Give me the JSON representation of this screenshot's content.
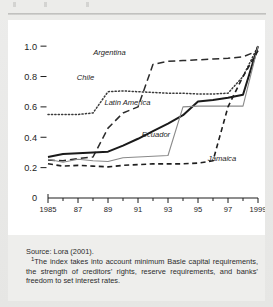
{
  "figure": {
    "background_color": "#e8e8e6",
    "panel_color": "#ffffff",
    "note_color": "#eeeeec"
  },
  "notes": {
    "source": "Source: Lora (2001).",
    "footnote_marker": "1",
    "footnote": "The index takes into account minimum Basle capital requirements, the strength of creditors’ rights, reserve requirements, and banks’ freedom to set interest rates."
  },
  "chart_data": {
    "type": "line",
    "title": "",
    "subtitle": "",
    "xlabel": "",
    "ylabel": "",
    "xlim": [
      1985,
      1999
    ],
    "ylim": [
      0,
      1.08
    ],
    "grid": false,
    "legend": "inline-labels",
    "y_ticks": [
      "0",
      "0.2",
      "0.4",
      "0.6",
      "0.8",
      "1.0"
    ],
    "y_tick_values": [
      0,
      0.2,
      0.4,
      0.6,
      0.8,
      1.0
    ],
    "x_ticks": [
      "1985",
      "87",
      "89",
      "91",
      "93",
      "95",
      "97",
      "1999"
    ],
    "x_tick_values": [
      1985,
      1987,
      1989,
      1991,
      1993,
      1995,
      1997,
      1999
    ],
    "x_minor_ticks": [
      1986,
      1988,
      1990,
      1992,
      1994,
      1996,
      1998
    ],
    "x": [
      1985,
      1986,
      1987,
      1988,
      1989,
      1990,
      1991,
      1992,
      1993,
      1994,
      1995,
      1996,
      1997,
      1998,
      1999
    ],
    "series": [
      {
        "name": "Argentina",
        "style": "long-dashed",
        "color": "#2b2b2b",
        "values": [
          0.25,
          0.245,
          0.26,
          0.27,
          0.46,
          0.56,
          0.6,
          0.88,
          0.9,
          0.905,
          0.91,
          0.915,
          0.92,
          0.93,
          0.97
        ],
        "label_x": 1989.1,
        "label_y": 0.945
      },
      {
        "name": "Chile",
        "style": "dotted",
        "color": "#3a3a3a",
        "values": [
          0.55,
          0.55,
          0.55,
          0.56,
          0.7,
          0.705,
          0.7,
          0.695,
          0.69,
          0.69,
          0.685,
          0.685,
          0.69,
          0.8,
          1.0
        ],
        "label_x": 1987.5,
        "label_y": 0.775
      },
      {
        "name": "Latin America",
        "style": "solid-thick",
        "color": "#1a1a1a",
        "values": [
          0.27,
          0.29,
          0.295,
          0.3,
          0.305,
          0.345,
          0.39,
          0.44,
          0.49,
          0.545,
          0.635,
          0.645,
          0.66,
          0.68,
          1.0
        ],
        "label_x": 1990.3,
        "label_y": 0.615
      },
      {
        "name": "Ecuador",
        "style": "solid-thin",
        "color": "#8a8a8a",
        "values": [
          0.255,
          0.235,
          0.255,
          0.245,
          0.24,
          0.265,
          0.27,
          0.275,
          0.28,
          0.6,
          0.605,
          0.605,
          0.605,
          0.605,
          1.0
        ],
        "label_x": 1992.2,
        "label_y": 0.4
      },
      {
        "name": "Jamaica",
        "style": "dashed",
        "color": "#1f1f1f",
        "values": [
          0.225,
          0.21,
          0.215,
          0.21,
          0.205,
          0.215,
          0.22,
          0.225,
          0.225,
          0.225,
          0.23,
          0.245,
          0.6,
          0.8,
          0.97
        ],
        "label_x": 1996.6,
        "label_y": 0.245
      }
    ]
  }
}
